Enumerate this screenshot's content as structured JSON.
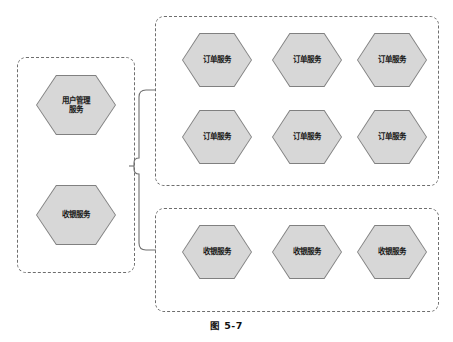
{
  "figure": {
    "caption": "图 5-7",
    "background_color": "#ffffff"
  },
  "style": {
    "hexagon_fill": "#d7d7d7",
    "hexagon_stroke": "#808080",
    "group_border_color": "#6e6e6e",
    "connector_color": "#6e6e6e",
    "text_color": "#1a1a1a"
  },
  "groups": [
    {
      "id": "left",
      "name": "source-services-group",
      "nodes": [
        {
          "id": "user-mgmt",
          "label": "用户管理\n服务",
          "shape": "hexagon"
        },
        {
          "id": "cashier-left",
          "label": "收银服务",
          "shape": "hexagon"
        }
      ]
    },
    {
      "id": "order",
      "name": "order-service-instances-group",
      "rows": [
        [
          {
            "id": "order-1",
            "label": "订单服务",
            "shape": "hexagon"
          },
          {
            "id": "order-2",
            "label": "订单服务",
            "shape": "hexagon"
          },
          {
            "id": "order-3",
            "label": "订单服务",
            "shape": "hexagon"
          }
        ],
        [
          {
            "id": "order-4",
            "label": "订单服务",
            "shape": "hexagon"
          },
          {
            "id": "order-5",
            "label": "订单服务",
            "shape": "hexagon"
          },
          {
            "id": "order-6",
            "label": "订单服务",
            "shape": "hexagon"
          }
        ]
      ]
    },
    {
      "id": "cashier",
      "name": "cashier-service-instances-group",
      "rows": [
        [
          {
            "id": "cashier-1",
            "label": "收银服务",
            "shape": "hexagon"
          },
          {
            "id": "cashier-2",
            "label": "收银服务",
            "shape": "hexagon"
          },
          {
            "id": "cashier-3",
            "label": "收银服务",
            "shape": "hexagon"
          }
        ]
      ]
    }
  ],
  "connectors": [
    {
      "id": "brace-to-order",
      "from": "left-group",
      "to": "order-group",
      "style": "rounded-brace"
    },
    {
      "id": "brace-to-cashier",
      "from": "left-group",
      "to": "cashier-group",
      "style": "rounded-brace"
    }
  ]
}
